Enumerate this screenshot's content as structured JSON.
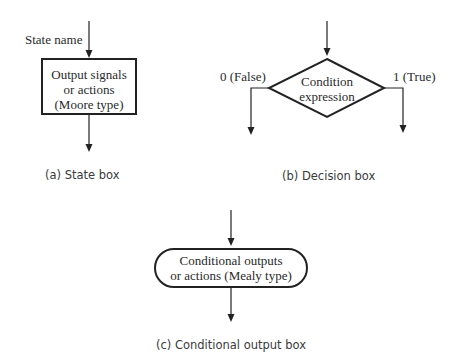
{
  "state_box": {
    "state_name_label": "State name",
    "content_lines": [
      "Output signals",
      "or actions",
      "(Moore type)"
    ],
    "caption": "(a) State box"
  },
  "decision_box": {
    "content_lines": [
      "Condition",
      "expression"
    ],
    "false_label": "0 (False)",
    "true_label": "1 (True)",
    "caption": "(b) Decision box"
  },
  "conditional_box": {
    "content_lines": [
      "Conditional outputs",
      "or actions (Mealy type)"
    ],
    "caption": "(c) Conditional output box"
  },
  "colors": {
    "stroke": "#222222",
    "text": "#2a2a2a",
    "background": "#ffffff"
  }
}
